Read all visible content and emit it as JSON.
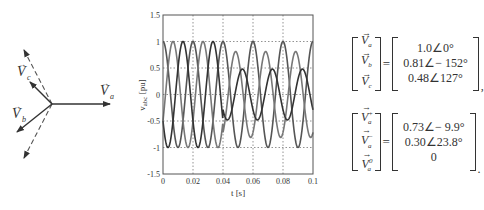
{
  "phasor_diagram": {
    "labels": {
      "a": {
        "symbol": "V",
        "sub": "a"
      },
      "b": {
        "symbol": "V",
        "sub": "b"
      },
      "c": {
        "symbol": "V",
        "sub": "c"
      }
    },
    "phasors": [
      {
        "name": "Va",
        "magnitude": 1.0,
        "angle_deg": 0,
        "style": "solid"
      },
      {
        "name": "Vb",
        "magnitude": 0.81,
        "angle_deg": -152,
        "style": "solid"
      },
      {
        "name": "Vc",
        "magnitude": 0.48,
        "angle_deg": 127,
        "style": "solid"
      },
      {
        "name": "balanced-b",
        "magnitude": 1.0,
        "angle_deg": -120,
        "style": "dashed"
      },
      {
        "name": "balanced-c",
        "magnitude": 1.0,
        "angle_deg": 120,
        "style": "dashed"
      }
    ]
  },
  "chart_data": {
    "type": "line",
    "title": "",
    "xlabel": "t [s]",
    "ylabel": "v_abc [pu]",
    "ylabel_main": "v",
    "ylabel_sub": "abc",
    "ylabel_unit": "[pu]",
    "xlim": [
      0,
      0.1
    ],
    "ylim": [
      -1.5,
      1.5
    ],
    "xticks": [
      0,
      0.02,
      0.04,
      0.06,
      0.08,
      0.1
    ],
    "xtick_labels": [
      "0",
      "0.02",
      "0.04",
      "0.06",
      "0.08",
      "0.1"
    ],
    "yticks": [
      -1.5,
      -1,
      -0.5,
      0,
      0.5,
      1,
      1.5
    ],
    "ytick_labels": [
      "-1.5",
      "-1",
      "-0.5",
      "0",
      "0.5",
      "1",
      "1.5"
    ],
    "grid": true,
    "frequency_hz": 50,
    "fault_time_s": 0.04,
    "series": [
      {
        "name": "v_a",
        "pre_amplitude": 1.0,
        "pre_phase_deg": 90,
        "post_amplitude": 1.0,
        "post_phase_deg": 90,
        "color": "#555555"
      },
      {
        "name": "v_b",
        "pre_amplitude": 1.0,
        "pre_phase_deg": -30,
        "post_amplitude": 0.81,
        "post_phase_deg": -62,
        "color": "#777777"
      },
      {
        "name": "v_c",
        "pre_amplitude": 1.0,
        "pre_phase_deg": 210,
        "post_amplitude": 0.48,
        "post_phase_deg": 217,
        "color": "#333333"
      }
    ]
  },
  "equations": {
    "eq1": {
      "lhs": [
        {
          "symbol": "V",
          "sub": "a",
          "sup": ""
        },
        {
          "symbol": "V",
          "sub": "b",
          "sup": ""
        },
        {
          "symbol": "V",
          "sub": "c",
          "sup": ""
        }
      ],
      "equals": "=",
      "rhs": [
        "1.0∠0°",
        "0.81∠− 152°",
        "0.48∠127°"
      ],
      "punct": ","
    },
    "eq2": {
      "lhs": [
        {
          "symbol": "V",
          "sub": "a",
          "sup": "+"
        },
        {
          "symbol": "V",
          "sub": "a",
          "sup": "−"
        },
        {
          "symbol": "V",
          "sub": "a",
          "sup": "0"
        }
      ],
      "equals": "=",
      "rhs": [
        "0.73∠− 9.9°",
        "0.30∠23.8°",
        "0"
      ],
      "punct": "."
    }
  }
}
